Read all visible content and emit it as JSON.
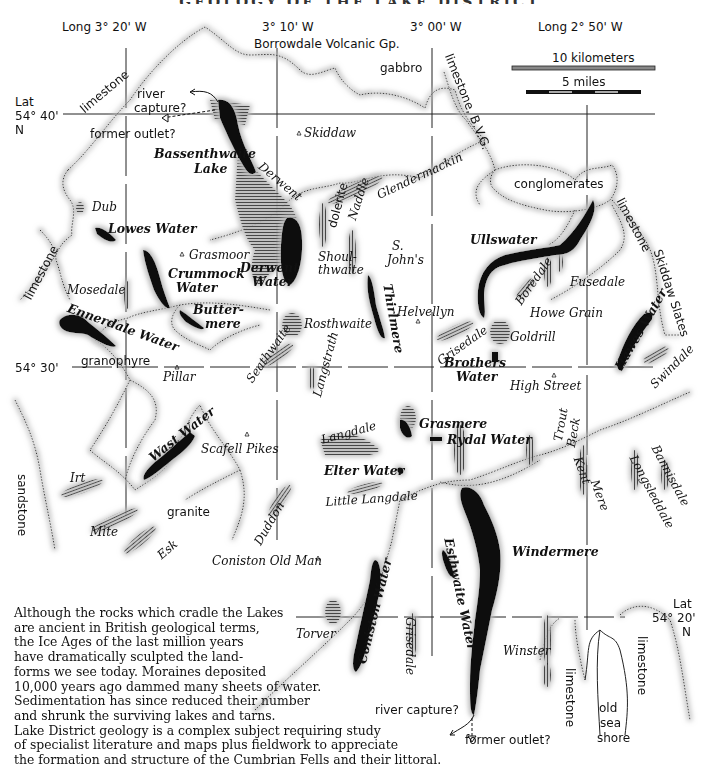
{
  "title": "GEOLOGY OF THE LAKE DISTRICT",
  "grid": {
    "longitudes": [
      {
        "label": "Long 3° 20' W"
      },
      {
        "label": "3° 10' W"
      },
      {
        "label": "3° 00' W"
      },
      {
        "label": "Long 2° 50' W"
      }
    ],
    "latitudes": [
      {
        "label_lines": [
          "Lat",
          "54° 40'",
          "N"
        ]
      },
      {
        "label": "54° 30'"
      },
      {
        "label_lines": [
          "Lat",
          "54° 20'",
          "N"
        ]
      }
    ]
  },
  "scale": {
    "km_label": "10 kilometers",
    "miles_label": "5 miles"
  },
  "geology_labels": {
    "bvg": "Borrowdale Volcanic Gp.",
    "gabbro": "gabbro",
    "limestone_nw": "limestone",
    "limestone_bvg": "limestone, B.V.G.",
    "limestone_w": "limestone",
    "conglomerates": "conglomerates",
    "limestone_e": "limestone",
    "skiddaw_slates": "Skiddaw Slates",
    "granophyre": "granophyre",
    "dolerite": "dolerite",
    "sandstone": "sandstone",
    "granite": "granite",
    "limestone_s1": "limestone",
    "limestone_s2": "limestone",
    "old_sea_shore": [
      "old",
      "sea",
      "shore"
    ]
  },
  "annotations": {
    "river_capture_n": [
      "river",
      "capture?"
    ],
    "former_outlet_n": "former outlet?",
    "river_capture_s": "river capture?",
    "former_outlet_s": "former outlet?"
  },
  "lakes": {
    "bassenthwaite": [
      "Bassenthwaite",
      "Lake"
    ],
    "lowes_water": "Lowes Water",
    "crummock": [
      "Crummock",
      "Water"
    ],
    "derwent_water": [
      "Derwent",
      "Water"
    ],
    "buttermere": [
      "Butter-",
      "mere"
    ],
    "ennerdale": "Ennerdale Water",
    "thirlmere": "Thirlmere",
    "ullswater": "Ullswater",
    "hawes_water": "Hawes Water",
    "brothers_water": [
      "Brothers",
      "Water"
    ],
    "wast_water": "Wast Water",
    "grasmere": "Grasmere",
    "rydal_water": "Rydal Water",
    "elter_water": "Elter Water",
    "windermere": "Windermere",
    "esthwaite_water": "Esthwaite Water",
    "coniston_water": "Coniston Water"
  },
  "valleys": {
    "dub": "Dub",
    "mosedale": "Mosedale",
    "derwent": "Derwent",
    "naddle": "Naddle",
    "glendermackin": "Glendermackin",
    "shoulthwaite": [
      "Shoul-",
      "thwaite"
    ],
    "st_johns": [
      "S.",
      "John's"
    ],
    "rosthwaite": "Rosthwaite",
    "seathwaite": "Seathwaite",
    "langstrath": "Langstrath",
    "boredale": "Boredale",
    "fusedale": "Fusedale",
    "howe_grain": "Howe Grain",
    "goldrill": "Goldrill",
    "grisedale_n": "Grisedale",
    "swindale": "Swindale",
    "irt": "Irt",
    "mite": "Mite",
    "esk": "Esk",
    "duddon": "Duddon",
    "langdale": "Langdale",
    "little_langdale": "Little Langdale",
    "trout_beck": [
      "Trout",
      "Beck"
    ],
    "kent": "Kent",
    "kentmere_mere": "Mere",
    "longsleddale": "Longsleddale",
    "bannisdale": "Bannisdale",
    "torver": "Torver",
    "grisedale_s": "Grisedale",
    "winster": "Winster"
  },
  "peaks": {
    "skiddaw": "Skiddaw",
    "grasmoor": "Grasmoor",
    "helvellyn": "Helvellyn",
    "pillar": "Pillar",
    "high_street": "High Street",
    "scafell_pikes": "Scafell Pikes",
    "coniston_old_man": "Coniston Old Man"
  },
  "caption": {
    "lines": [
      "Although the rocks which cradle the Lakes",
      "are ancient in British geological terms,",
      "the Ice Ages of the last million years",
      "have dramatically sculpted the land-",
      "forms we see today.  Moraines deposited",
      "10,000 years ago dammed many sheets of water.",
      "Sedimentation has since reduced their number",
      "and shrunk the surviving lakes and tarns.",
      "Lake District geology is a complex subject requiring study",
      "of specialist literature and maps plus fieldwork to appreciate",
      "the formation and structure of the Cumbrian Fells and their littoral."
    ]
  },
  "colors": {
    "ink": "#111111",
    "halo": "#c8c8c8",
    "paper": "#ffffff"
  }
}
